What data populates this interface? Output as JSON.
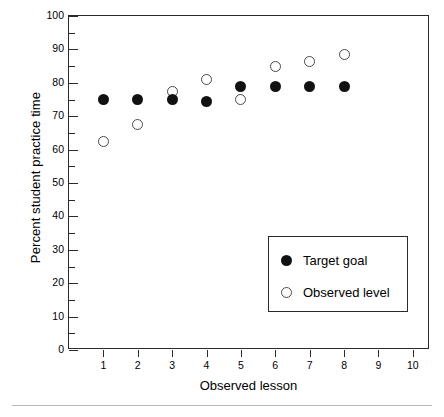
{
  "chart_data": {
    "type": "scatter",
    "title": "",
    "xlabel": "Observed lesson",
    "ylabel": "Percent student practice time",
    "xlim": [
      0,
      10.5
    ],
    "ylim": [
      0,
      100
    ],
    "x_ticks": [
      1,
      2,
      3,
      4,
      5,
      6,
      7,
      8,
      9,
      10
    ],
    "y_ticks": [
      0,
      10,
      20,
      30,
      40,
      50,
      60,
      70,
      80,
      90,
      100
    ],
    "y_minor_ticks": [
      5,
      15,
      25,
      35,
      45,
      55,
      65,
      75,
      85,
      95
    ],
    "grid": false,
    "legend_position": "inside-lower-right",
    "categories": [
      1,
      2,
      3,
      4,
      5,
      6,
      7,
      8
    ],
    "series": [
      {
        "name": "Target goal",
        "marker": "filled-circle",
        "color": "#111111",
        "values": [
          75,
          75,
          75,
          74.5,
          79,
          79,
          79,
          79
        ]
      },
      {
        "name": "Observed level",
        "marker": "open-circle",
        "color": "#ffffff",
        "edge_color": "#4a4a4a",
        "values": [
          62.5,
          67.5,
          77.5,
          81,
          75,
          85,
          86.5,
          88.5
        ]
      }
    ]
  },
  "legend": {
    "entries": [
      {
        "label": "Target goal",
        "marker": "filled-circle"
      },
      {
        "label": "Observed level",
        "marker": "open-circle"
      }
    ]
  }
}
